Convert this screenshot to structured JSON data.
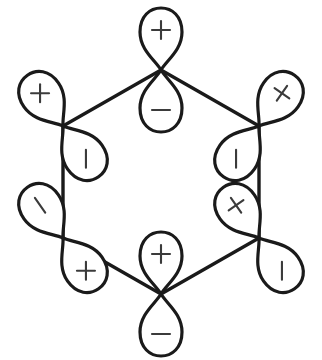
{
  "figure": {
    "background_color": "#ffffff",
    "line_color": "#1a1a1a",
    "sign_color": "#3b3b3b",
    "plus_sign": "+",
    "minus_sign": "-"
  },
  "chart_data": {
    "type": "diagram",
    "ring": {
      "shape": "hexagon",
      "vertex_count": 6,
      "center": [
        161,
        182
      ],
      "vertices": [
        {
          "name": "top",
          "x": 161,
          "y": 70
        },
        {
          "name": "upper-right",
          "x": 259,
          "y": 126
        },
        {
          "name": "lower-right",
          "x": 259,
          "y": 238
        },
        {
          "name": "bottom",
          "x": 161,
          "y": 294
        },
        {
          "name": "lower-left",
          "x": 63,
          "y": 238
        },
        {
          "name": "upper-left",
          "x": 63,
          "y": 126
        }
      ],
      "bonds": [
        [
          "top",
          "upper-right"
        ],
        [
          "upper-right",
          "lower-right"
        ],
        [
          "lower-right",
          "bottom"
        ],
        [
          "bottom",
          "lower-left"
        ],
        [
          "lower-left",
          "upper-left"
        ],
        [
          "upper-left",
          "top"
        ]
      ]
    },
    "orbitals": [
      {
        "vertex": "top",
        "x": 161,
        "y": 70,
        "rotation_deg": 0,
        "positive_lobe": {
          "direction": "up",
          "sign": "+"
        },
        "negative_lobe": {
          "direction": "down",
          "sign": "-"
        }
      },
      {
        "vertex": "upper-right",
        "x": 259,
        "y": 126,
        "rotation_deg": 35,
        "positive_lobe": {
          "direction": "upper-right",
          "sign": "+"
        },
        "negative_lobe": {
          "direction": "lower-left",
          "sign": "-"
        }
      },
      {
        "vertex": "lower-right",
        "x": 259,
        "y": 238,
        "rotation_deg": -35,
        "positive_lobe": {
          "direction": "upper-left",
          "sign": "+"
        },
        "negative_lobe": {
          "direction": "lower-right",
          "sign": "-"
        }
      },
      {
        "vertex": "bottom",
        "x": 161,
        "y": 294,
        "rotation_deg": 0,
        "positive_lobe": {
          "direction": "up",
          "sign": "+"
        },
        "negative_lobe": {
          "direction": "down",
          "sign": "-"
        }
      },
      {
        "vertex": "lower-left",
        "x": 63,
        "y": 238,
        "rotation_deg": 35,
        "positive_lobe": {
          "direction": "lower-left",
          "sign": "+"
        },
        "negative_lobe": {
          "direction": "upper-right",
          "sign": "-"
        }
      },
      {
        "vertex": "upper-left",
        "x": 63,
        "y": 126,
        "rotation_deg": -35,
        "positive_lobe": {
          "direction": "upper-left",
          "sign": "+"
        },
        "negative_lobe": {
          "direction": "lower-right",
          "sign": "-"
        }
      }
    ]
  }
}
